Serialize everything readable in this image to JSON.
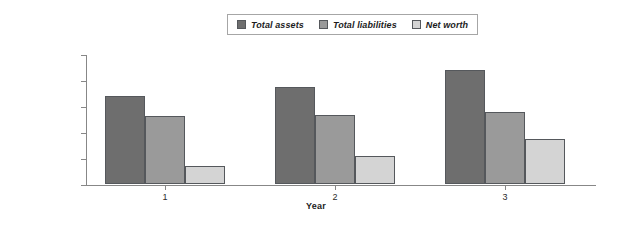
{
  "chart_data": {
    "type": "bar",
    "title": "",
    "subtitle": "",
    "xlabel": "Year",
    "ylabel": "",
    "categories": [
      "1",
      "2",
      "3"
    ],
    "series": [
      {
        "name": "Total assets",
        "color": "#6E6E6E",
        "values": [
          170000,
          187000,
          220000
        ]
      },
      {
        "name": "Total liabilities",
        "color": "#9A9A9A",
        "values": [
          130000,
          133000,
          138000
        ]
      },
      {
        "name": "Net worth",
        "color": "#D4D4D4",
        "values": [
          35000,
          54000,
          86000
        ]
      }
    ],
    "ylim": [
      0,
      250000
    ],
    "ytick_values": [
      0,
      50000,
      100000,
      150000,
      200000,
      250000
    ],
    "ytick_labels": [
      "$0",
      "$50,000",
      "$100,000",
      "$150,000",
      "$200,000",
      "$250,000"
    ],
    "xtick_labels": [
      "1",
      "2",
      "3"
    ],
    "grid": false,
    "legend_position": "top-center",
    "legend_entries": [
      "Total assets",
      "Total liabilities",
      "Net worth"
    ],
    "annotations": []
  },
  "colors": {
    "total_assets": "#6E6E6E",
    "total_liabilities": "#9A9A9A",
    "net_worth": "#D4D4D4",
    "axis": "#878787",
    "bar_outline": "#55585C",
    "background": "#FFFFFF",
    "text": "#1C1C1C"
  }
}
